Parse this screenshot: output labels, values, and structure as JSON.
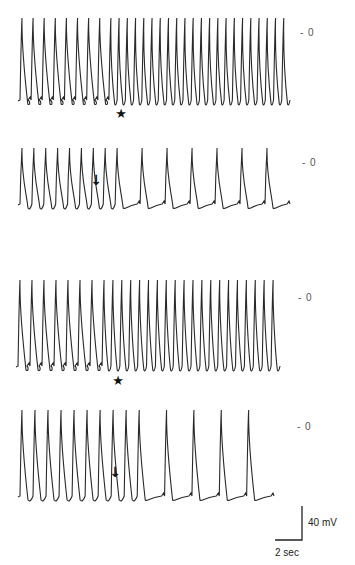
{
  "figure": {
    "panels": [
      {
        "id": "trace-1",
        "zero_label": "- 0",
        "marker": "star",
        "marker_symbol": "★",
        "pattern": [
          {
            "mode": "slow",
            "count": 8
          },
          {
            "mode": "fast",
            "count": 22
          }
        ]
      },
      {
        "id": "trace-2",
        "zero_label": "- 0",
        "marker": "arrow",
        "marker_symbol": "↓",
        "pattern": [
          {
            "mode": "fast",
            "count": 8
          },
          {
            "mode": "slow",
            "count": 7
          }
        ]
      },
      {
        "id": "trace-3",
        "zero_label": "- 0",
        "marker": "star",
        "marker_symbol": "★",
        "pattern": [
          {
            "mode": "slow",
            "count": 7
          },
          {
            "mode": "fast",
            "count": 20
          }
        ]
      },
      {
        "id": "trace-4",
        "zero_label": "- 0",
        "marker": "arrow",
        "marker_symbol": "↓",
        "pattern": [
          {
            "mode": "fast",
            "count": 9
          },
          {
            "mode": "slow",
            "count": 5
          }
        ]
      }
    ],
    "scale_bar": {
      "voltage_label": "40 mV",
      "time_label": "2 sec"
    },
    "colors": {
      "trace": "#2a2a2a",
      "background": "#ffffff",
      "label": "#555555"
    }
  }
}
